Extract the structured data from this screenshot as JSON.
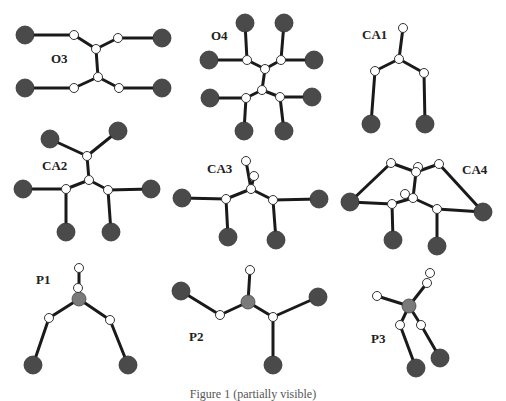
{
  "figure": {
    "caption": "Figure 1  (partially visible)",
    "colors": {
      "background": "#ffffff",
      "bond": "#1a1a1a",
      "heavy_atom": "#4a4a4a",
      "center_atom": "#7a7a7a",
      "small_atom_fill": "#ffffff",
      "small_atom_stroke": "#333333",
      "label": "#222222"
    },
    "panels": [
      {
        "id": "O3",
        "label": "O3",
        "label_pos": [
          51,
          52
        ],
        "big": [
          [
            25,
            35
          ],
          [
            25,
            88
          ],
          [
            162,
            38
          ],
          [
            162,
            88
          ]
        ],
        "center": [],
        "small": [
          [
            74,
            35
          ],
          [
            118,
            38
          ],
          [
            96,
            49
          ],
          [
            98,
            77
          ],
          [
            74,
            88
          ],
          [
            119,
            88
          ]
        ],
        "bonds": [
          [
            25,
            35,
            74,
            35
          ],
          [
            74,
            35,
            96,
            49
          ],
          [
            96,
            49,
            118,
            38
          ],
          [
            118,
            38,
            162,
            38
          ],
          [
            96,
            49,
            98,
            77
          ],
          [
            98,
            77,
            74,
            88
          ],
          [
            74,
            88,
            25,
            88
          ],
          [
            98,
            77,
            119,
            88
          ],
          [
            119,
            88,
            162,
            88
          ]
        ]
      },
      {
        "id": "O4",
        "label": "O4",
        "label_pos": [
          211,
          29
        ],
        "big": [
          [
            245,
            23
          ],
          [
            284,
            23
          ],
          [
            209,
            60
          ],
          [
            314,
            60
          ],
          [
            210,
            98
          ],
          [
            312,
            97
          ],
          [
            244,
            131
          ],
          [
            284,
            131
          ]
        ],
        "center": [],
        "small": [
          [
            247,
            60
          ],
          [
            281,
            60
          ],
          [
            265,
            69
          ],
          [
            262,
            90
          ],
          [
            246,
            98
          ],
          [
            280,
            97
          ]
        ],
        "bonds": [
          [
            245,
            23,
            247,
            60
          ],
          [
            209,
            60,
            247,
            60
          ],
          [
            247,
            60,
            265,
            69
          ],
          [
            284,
            23,
            281,
            60
          ],
          [
            314,
            60,
            281,
            60
          ],
          [
            281,
            60,
            265,
            69
          ],
          [
            265,
            69,
            262,
            90
          ],
          [
            262,
            90,
            246,
            98
          ],
          [
            246,
            98,
            210,
            98
          ],
          [
            246,
            98,
            244,
            131
          ],
          [
            262,
            90,
            280,
            97
          ],
          [
            280,
            97,
            312,
            97
          ],
          [
            280,
            97,
            284,
            131
          ]
        ]
      },
      {
        "id": "CA1",
        "label": "CA1",
        "label_pos": [
          362,
          28
        ],
        "big": [
          [
            371,
            124
          ],
          [
            425,
            124
          ]
        ],
        "center": [],
        "small": [
          [
            403,
            28
          ],
          [
            399,
            59
          ],
          [
            375,
            71
          ],
          [
            424,
            73
          ]
        ],
        "bonds": [
          [
            403,
            28,
            399,
            59
          ],
          [
            399,
            59,
            375,
            71
          ],
          [
            399,
            59,
            424,
            73
          ],
          [
            375,
            71,
            371,
            124
          ],
          [
            424,
            73,
            425,
            124
          ]
        ]
      },
      {
        "id": "CA2",
        "label": "CA2",
        "label_pos": [
          42,
          159
        ],
        "big": [
          [
            50,
            139
          ],
          [
            118,
            131
          ],
          [
            23,
            189
          ],
          [
            151,
            189
          ],
          [
            66,
            232
          ],
          [
            111,
            232
          ]
        ],
        "center": [],
        "small": [
          [
            87,
            156
          ],
          [
            89,
            180
          ],
          [
            66,
            189
          ],
          [
            108,
            190
          ]
        ],
        "bonds": [
          [
            50,
            139,
            87,
            156
          ],
          [
            118,
            131,
            87,
            156
          ],
          [
            87,
            156,
            89,
            180
          ],
          [
            89,
            180,
            66,
            189
          ],
          [
            89,
            180,
            108,
            190
          ],
          [
            23,
            189,
            66,
            189
          ],
          [
            66,
            189,
            66,
            232
          ],
          [
            108,
            190,
            151,
            189
          ],
          [
            108,
            190,
            111,
            232
          ]
        ]
      },
      {
        "id": "CA3",
        "label": "CA3",
        "label_pos": [
          207,
          162
        ],
        "big": [
          [
            182,
            198
          ],
          [
            319,
            199
          ],
          [
            228,
            237
          ],
          [
            276,
            240
          ]
        ],
        "center": [],
        "small": [
          [
            246,
            161
          ],
          [
            254,
            176
          ],
          [
            251,
            189
          ],
          [
            226,
            199
          ],
          [
            273,
            200
          ]
        ],
        "bonds": [
          [
            246,
            161,
            251,
            189
          ],
          [
            254,
            176,
            251,
            189
          ],
          [
            251,
            189,
            226,
            199
          ],
          [
            251,
            189,
            273,
            200
          ],
          [
            182,
            198,
            226,
            199
          ],
          [
            226,
            199,
            228,
            237
          ],
          [
            273,
            200,
            319,
            199
          ],
          [
            273,
            200,
            276,
            240
          ]
        ]
      },
      {
        "id": "CA4",
        "label": "CA4",
        "label_pos": [
          462,
          163
        ],
        "big": [
          [
            350,
            202
          ],
          [
            483,
            212
          ],
          [
            393,
            240
          ],
          [
            437,
            246
          ]
        ],
        "center": [],
        "small": [
          [
            391,
            163
          ],
          [
            439,
            164
          ],
          [
            418,
            167
          ],
          [
            416,
            172
          ],
          [
            405,
            194
          ],
          [
            413,
            198
          ],
          [
            392,
            204
          ],
          [
            437,
            209
          ]
        ],
        "bonds": [
          [
            350,
            202,
            391,
            163
          ],
          [
            391,
            163,
            416,
            172
          ],
          [
            416,
            172,
            439,
            164
          ],
          [
            439,
            164,
            483,
            212
          ],
          [
            416,
            172,
            413,
            198
          ],
          [
            413,
            198,
            392,
            204
          ],
          [
            413,
            198,
            437,
            209
          ],
          [
            350,
            202,
            392,
            204
          ],
          [
            392,
            204,
            393,
            240
          ],
          [
            437,
            209,
            483,
            212
          ],
          [
            437,
            209,
            437,
            246
          ]
        ]
      },
      {
        "id": "P1",
        "label": "P1",
        "label_pos": [
          36,
          273
        ],
        "big": [
          [
            33,
            365
          ],
          [
            128,
            365
          ]
        ],
        "center": [
          [
            79,
            299
          ]
        ],
        "small": [
          [
            79,
            268
          ],
          [
            78,
            288
          ],
          [
            49,
            318
          ],
          [
            110,
            320
          ]
        ],
        "bonds": [
          [
            79,
            268,
            79,
            299
          ],
          [
            79,
            299,
            49,
            318
          ],
          [
            79,
            299,
            110,
            320
          ],
          [
            49,
            318,
            33,
            365
          ],
          [
            110,
            320,
            128,
            365
          ]
        ]
      },
      {
        "id": "P2",
        "label": "P2",
        "label_pos": [
          189,
          330
        ],
        "big": [
          [
            181,
            291
          ],
          [
            318,
            297
          ],
          [
            273,
            365
          ]
        ],
        "center": [
          [
            248,
            302
          ]
        ],
        "small": [
          [
            250,
            270
          ],
          [
            220,
            315
          ],
          [
            273,
            317
          ]
        ],
        "bonds": [
          [
            250,
            270,
            248,
            302
          ],
          [
            181,
            291,
            220,
            315
          ],
          [
            220,
            315,
            248,
            302
          ],
          [
            248,
            302,
            273,
            317
          ],
          [
            273,
            317,
            318,
            297
          ],
          [
            273,
            317,
            273,
            365
          ]
        ]
      },
      {
        "id": "P3",
        "label": "P3",
        "label_pos": [
          371,
          332
        ],
        "big": [
          [
            416,
            368
          ],
          [
            440,
            358
          ]
        ],
        "center": [
          [
            409,
            306
          ]
        ],
        "small": [
          [
            430,
            273
          ],
          [
            427,
            283
          ],
          [
            377,
            296
          ],
          [
            400,
            325
          ],
          [
            421,
            325
          ]
        ],
        "bonds": [
          [
            427,
            283,
            409,
            306
          ],
          [
            377,
            296,
            409,
            306
          ],
          [
            409,
            306,
            400,
            325
          ],
          [
            409,
            306,
            421,
            325
          ],
          [
            400,
            325,
            416,
            368
          ],
          [
            421,
            325,
            440,
            358
          ]
        ]
      }
    ]
  }
}
